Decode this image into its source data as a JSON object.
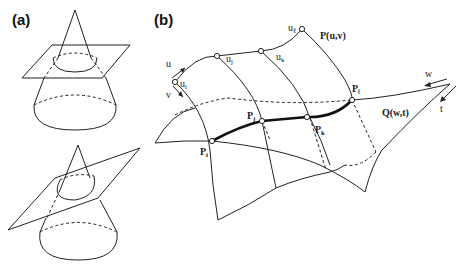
{
  "figure": {
    "panel_a": {
      "label": "(a)",
      "description": "Two cones intersected by planes: horizontal plane (circle section) and tilted plane (ellipse section)"
    },
    "panel_b": {
      "label": "(b)",
      "surface_P": "P(u,v)",
      "surface_Q": "Q(w,t)",
      "param_u": "u",
      "param_v": "v",
      "param_w": "w",
      "param_t": "t",
      "knots": [
        "u",
        "u",
        "u",
        "u"
      ],
      "knot_subs": [
        "i",
        "j",
        "k",
        "ℓ"
      ],
      "points": [
        "P",
        "P",
        "P",
        "P"
      ],
      "point_subs": [
        "i",
        "j",
        "k",
        "ℓ"
      ]
    }
  }
}
